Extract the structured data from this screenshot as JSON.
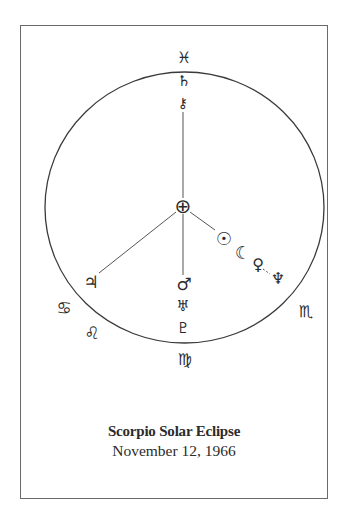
{
  "diagram": {
    "title": "Scorpio Solar Eclipse",
    "date": "November 12, 1966",
    "colors": {
      "ink": "#2a2a2a",
      "frame": "#6a6a6a",
      "background": "#ffffff"
    },
    "center_symbol": {
      "name": "earth",
      "glyph": "⊕"
    },
    "zodiac_signs": [
      {
        "name": "pisces",
        "glyph": "♓"
      },
      {
        "name": "cancer",
        "glyph": "♋"
      },
      {
        "name": "leo",
        "glyph": "♌"
      },
      {
        "name": "virgo",
        "glyph": "♍"
      },
      {
        "name": "scorpio",
        "glyph": "♏"
      }
    ],
    "planets": [
      {
        "name": "saturn",
        "glyph": "♄"
      },
      {
        "name": "chiron",
        "glyph": "⚷"
      },
      {
        "name": "sun",
        "glyph": "☉"
      },
      {
        "name": "moon",
        "glyph": "☾"
      },
      {
        "name": "venus",
        "glyph": "♀"
      },
      {
        "name": "neptune",
        "glyph": "♆"
      },
      {
        "name": "jupiter",
        "glyph": "♃"
      },
      {
        "name": "mars",
        "glyph": "♂"
      },
      {
        "name": "uranus",
        "glyph": "♅"
      },
      {
        "name": "pluto",
        "glyph": "♇"
      }
    ]
  }
}
